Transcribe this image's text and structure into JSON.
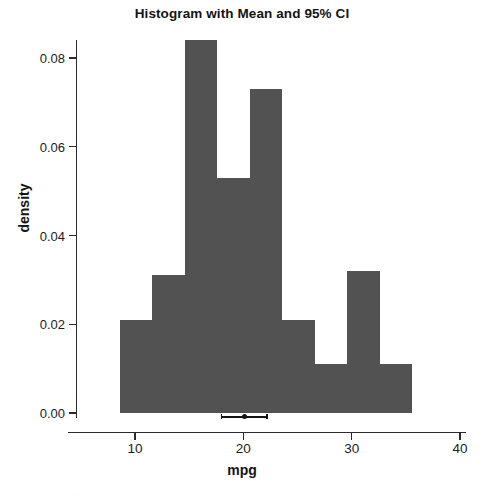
{
  "chart_data": {
    "type": "bar",
    "title": "Histogram with Mean and 95% CI",
    "xlabel": "mpg",
    "ylabel": "density",
    "xlim": [
      7.0,
      40.5
    ],
    "ylim": [
      0.0,
      0.0875
    ],
    "grid": false,
    "legend": null,
    "bar_color": "#525252",
    "bin_width": 3,
    "bin_edges": [
      8.6,
      11.6,
      14.6,
      17.6,
      20.6,
      23.6,
      26.6,
      29.6,
      32.6,
      35.6
    ],
    "bin_centers": [
      10.1,
      13.1,
      16.1,
      19.1,
      22.1,
      25.1,
      28.1,
      31.1,
      34.1
    ],
    "values": [
      0.021,
      0.031,
      0.084,
      0.053,
      0.073,
      0.021,
      0.011,
      0.032,
      0.011
    ],
    "xticks": [
      10,
      20,
      30,
      40
    ],
    "xticklabels": [
      "10",
      "20",
      "30",
      "40"
    ],
    "yticks": [
      0.0,
      0.02,
      0.04,
      0.06,
      0.08
    ],
    "yticklabels": [
      "0.00",
      "0.02",
      "0.04",
      "0.06",
      "0.08"
    ],
    "annotations": {
      "mean": 20.09,
      "ci_lower": 17.92,
      "ci_upper": 22.26,
      "marker_y": 0.0,
      "marker_color": "#141414",
      "description": "Point marker at sample mean with horizontal 95% confidence interval whiskers drawn at density 0"
    }
  },
  "figure": {
    "title": "Histogram with Mean and 95% CI",
    "xlabel": "mpg",
    "ylabel": "density"
  },
  "artifact": {
    "text": "..."
  }
}
